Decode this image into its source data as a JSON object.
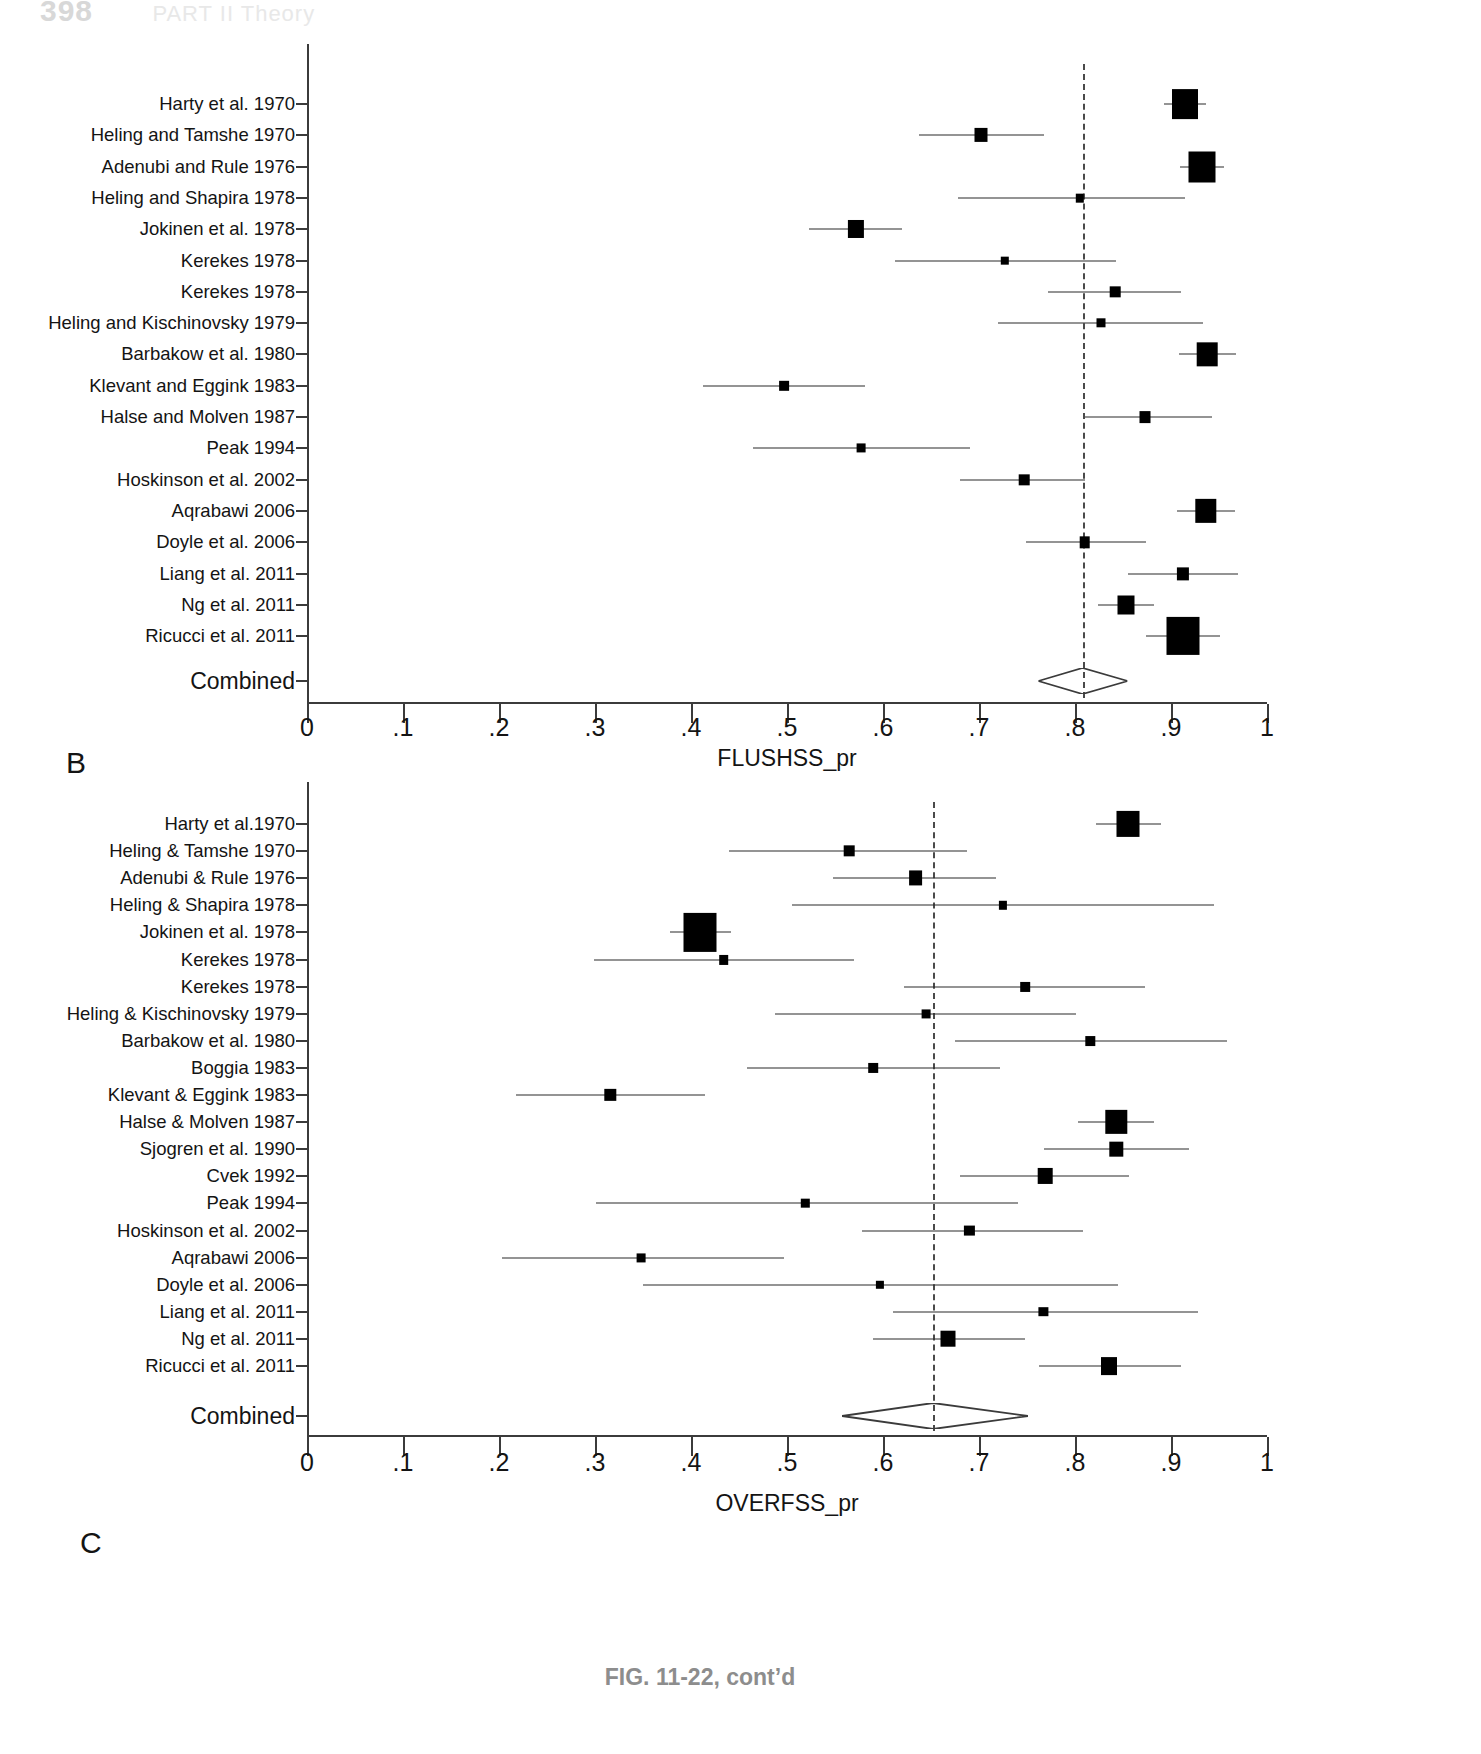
{
  "page": {
    "number": "398",
    "running_title": "PART II  Theory"
  },
  "caption": "FIG. 11-22, cont’d",
  "chart_data": [
    {
      "type": "forest",
      "panel": "A",
      "title": "",
      "xlabel": "FLUSHSS_pr",
      "ylabel": "",
      "xlim": [
        0,
        1
      ],
      "xticks": [
        0,
        0.1,
        0.2,
        0.3,
        0.4,
        0.5,
        0.6,
        0.7,
        0.8,
        0.9,
        1
      ],
      "xticklabels": [
        "0",
        ".1",
        ".2",
        ".3",
        ".4",
        ".5",
        ".6",
        ".7",
        ".8",
        ".9",
        "1"
      ],
      "grid": false,
      "null_line": 0.808,
      "summary_label": "Combined",
      "summary": {
        "estimate": 0.808,
        "ci_low": 0.762,
        "ci_high": 0.855
      },
      "studies": [
        {
          "label": "Harty et al. 1970",
          "estimate": 0.915,
          "ci_low": 0.893,
          "ci_high": 0.936,
          "weight": 0.95
        },
        {
          "label": "Heling and Tamshe 1970",
          "estimate": 0.702,
          "ci_low": 0.637,
          "ci_high": 0.768,
          "weight": 0.3
        },
        {
          "label": "Adenubi and Rule 1976",
          "estimate": 0.932,
          "ci_low": 0.909,
          "ci_high": 0.955,
          "weight": 1.0
        },
        {
          "label": "Heling and Shapira 1978",
          "estimate": 0.805,
          "ci_low": 0.678,
          "ci_high": 0.915,
          "weight": 0.07
        },
        {
          "label": "Jokinen et al. 1978",
          "estimate": 0.572,
          "ci_low": 0.523,
          "ci_high": 0.62,
          "weight": 0.46
        },
        {
          "label": "Kerekes 1978",
          "estimate": 0.727,
          "ci_low": 0.612,
          "ci_high": 0.843,
          "weight": 0.07
        },
        {
          "label": "Kerekes 1978",
          "estimate": 0.842,
          "ci_low": 0.772,
          "ci_high": 0.91,
          "weight": 0.18
        },
        {
          "label": "Heling and Kischinovsky 1979",
          "estimate": 0.827,
          "ci_low": 0.72,
          "ci_high": 0.933,
          "weight": 0.1
        },
        {
          "label": "Barbakow et al. 1980",
          "estimate": 0.938,
          "ci_low": 0.908,
          "ci_high": 0.968,
          "weight": 0.68
        },
        {
          "label": "Klevant and Eggink 1983",
          "estimate": 0.497,
          "ci_low": 0.413,
          "ci_high": 0.581,
          "weight": 0.14
        },
        {
          "label": "Halse and Molven 1987",
          "estimate": 0.873,
          "ci_low": 0.81,
          "ci_high": 0.943,
          "weight": 0.2
        },
        {
          "label": "Peak 1994",
          "estimate": 0.577,
          "ci_low": 0.465,
          "ci_high": 0.691,
          "weight": 0.09
        },
        {
          "label": "Hoskinson et al. 2002",
          "estimate": 0.747,
          "ci_low": 0.68,
          "ci_high": 0.81,
          "weight": 0.18
        },
        {
          "label": "Aqrabawi 2006",
          "estimate": 0.936,
          "ci_low": 0.906,
          "ci_high": 0.967,
          "weight": 0.72
        },
        {
          "label": "Doyle et al. 2006",
          "estimate": 0.81,
          "ci_low": 0.749,
          "ci_high": 0.874,
          "weight": 0.18
        },
        {
          "label": "Liang et al. 2011",
          "estimate": 0.912,
          "ci_low": 0.855,
          "ci_high": 0.97,
          "weight": 0.26
        },
        {
          "label": "Ng et al. 2011",
          "estimate": 0.853,
          "ci_low": 0.824,
          "ci_high": 0.882,
          "weight": 0.5
        },
        {
          "label": "Ricucci et al. 2011",
          "estimate": 0.913,
          "ci_low": 0.874,
          "ci_high": 0.951,
          "weight": 1.3
        }
      ]
    },
    {
      "type": "forest",
      "panel": "B",
      "title": "",
      "xlabel": "OVERFSS_pr",
      "ylabel": "",
      "xlim": [
        0,
        1
      ],
      "xticks": [
        0,
        0.1,
        0.2,
        0.3,
        0.4,
        0.5,
        0.6,
        0.7,
        0.8,
        0.9,
        1
      ],
      "xticklabels": [
        "0",
        ".1",
        ".2",
        ".3",
        ".4",
        ".5",
        ".6",
        ".7",
        ".8",
        ".9",
        "1"
      ],
      "grid": false,
      "null_line": 0.652,
      "summary_label": "Combined",
      "summary": {
        "estimate": 0.652,
        "ci_low": 0.557,
        "ci_high": 0.751
      },
      "studies": [
        {
          "label": "Harty et al.1970",
          "estimate": 0.855,
          "ci_low": 0.822,
          "ci_high": 0.89,
          "weight": 0.8
        },
        {
          "label": "Heling & Tamshe 1970",
          "estimate": 0.565,
          "ci_low": 0.44,
          "ci_high": 0.688,
          "weight": 0.18
        },
        {
          "label": "Adenubi & Rule 1976",
          "estimate": 0.634,
          "ci_low": 0.548,
          "ci_high": 0.718,
          "weight": 0.34
        },
        {
          "label": "Heling & Shapira 1978",
          "estimate": 0.725,
          "ci_low": 0.505,
          "ci_high": 0.945,
          "weight": 0.06
        },
        {
          "label": "Jokinen et al. 1978",
          "estimate": 0.409,
          "ci_low": 0.378,
          "ci_high": 0.442,
          "weight": 1.3
        },
        {
          "label": "Kerekes 1978",
          "estimate": 0.434,
          "ci_low": 0.299,
          "ci_high": 0.57,
          "weight": 0.13
        },
        {
          "label": "Kerekes 1978",
          "estimate": 0.748,
          "ci_low": 0.622,
          "ci_high": 0.873,
          "weight": 0.13
        },
        {
          "label": "Heling & Kischinovsky 1979",
          "estimate": 0.645,
          "ci_low": 0.487,
          "ci_high": 0.801,
          "weight": 0.09
        },
        {
          "label": "Barbakow et al. 1980",
          "estimate": 0.816,
          "ci_low": 0.675,
          "ci_high": 0.958,
          "weight": 0.12
        },
        {
          "label": "Boggia 1983",
          "estimate": 0.59,
          "ci_low": 0.458,
          "ci_high": 0.722,
          "weight": 0.13
        },
        {
          "label": "Klevant & Eggink 1983",
          "estimate": 0.316,
          "ci_low": 0.218,
          "ci_high": 0.415,
          "weight": 0.22
        },
        {
          "label": "Halse & Molven 1987",
          "estimate": 0.843,
          "ci_low": 0.803,
          "ci_high": 0.882,
          "weight": 0.72
        },
        {
          "label": "Sjogren et al. 1990",
          "estimate": 0.843,
          "ci_low": 0.768,
          "ci_high": 0.919,
          "weight": 0.32
        },
        {
          "label": "Cvek 1992",
          "estimate": 0.769,
          "ci_low": 0.68,
          "ci_high": 0.856,
          "weight": 0.38
        },
        {
          "label": "Peak 1994",
          "estimate": 0.519,
          "ci_low": 0.301,
          "ci_high": 0.741,
          "weight": 0.07
        },
        {
          "label": "Hoskinson et al. 2002",
          "estimate": 0.69,
          "ci_low": 0.578,
          "ci_high": 0.808,
          "weight": 0.16
        },
        {
          "label": "Aqrabawi 2006",
          "estimate": 0.348,
          "ci_low": 0.203,
          "ci_high": 0.497,
          "weight": 0.09
        },
        {
          "label": "Doyle et al. 2006",
          "estimate": 0.597,
          "ci_low": 0.35,
          "ci_high": 0.845,
          "weight": 0.06
        },
        {
          "label": "Liang et al. 2011",
          "estimate": 0.767,
          "ci_low": 0.61,
          "ci_high": 0.928,
          "weight": 0.11
        },
        {
          "label": "Ng et al. 2011",
          "estimate": 0.668,
          "ci_low": 0.59,
          "ci_high": 0.748,
          "weight": 0.4
        },
        {
          "label": "Ricucci et al. 2011",
          "estimate": 0.835,
          "ci_low": 0.763,
          "ci_high": 0.91,
          "weight": 0.45
        }
      ]
    }
  ],
  "panels": [
    {
      "letter": "A",
      "next_letter": "B"
    },
    {
      "letter": "B",
      "next_letter": "C"
    }
  ]
}
